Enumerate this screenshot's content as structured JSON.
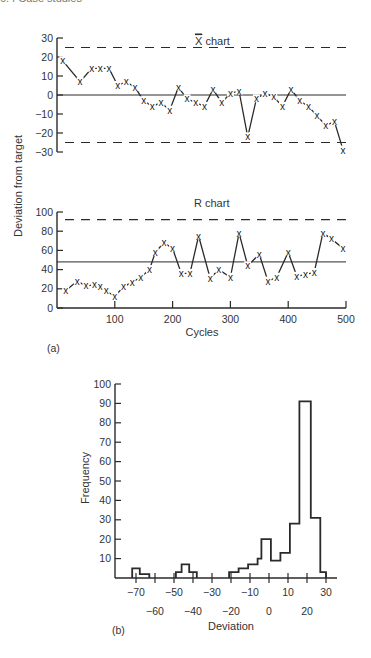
{
  "page": {
    "header_fragment": "6.4  Case studies"
  },
  "panel_a": {
    "label": "(a)",
    "ylabel": "Deviation from target",
    "xlabel": "Cycles",
    "xbar_title": "X chart",
    "r_title": "R chart"
  },
  "panel_b": {
    "label": "(b)",
    "ylabel": "Frequency",
    "xlabel": "Deviation"
  },
  "chart_data": [
    {
      "type": "line",
      "title": "X̄ chart",
      "xlabel": "Cycles",
      "ylabel": "Deviation from target",
      "xlim": [
        0,
        500
      ],
      "ylim": [
        -30,
        30
      ],
      "yticks": [
        30,
        20,
        10,
        0,
        -10,
        -20,
        -30
      ],
      "marker": "x",
      "center_line": 0,
      "upper_control_limit": 25,
      "lower_control_limit": -25,
      "x": [
        10,
        40,
        60,
        75,
        90,
        105,
        120,
        135,
        150,
        165,
        180,
        195,
        210,
        225,
        240,
        255,
        270,
        285,
        300,
        315,
        330,
        345,
        360,
        375,
        390,
        405,
        420,
        435,
        450,
        465,
        480,
        495
      ],
      "values": [
        18,
        7,
        14,
        14,
        14,
        5,
        7,
        4,
        -3,
        -6,
        -4,
        -8,
        4,
        -2,
        -4,
        -6,
        3,
        -4,
        1,
        2,
        -22,
        -2,
        1,
        -1,
        -6,
        3,
        -3,
        -6,
        -11,
        -16,
        -14,
        -29
      ]
    },
    {
      "type": "line",
      "title": "R chart",
      "xlabel": "Cycles",
      "ylabel": "Deviation from target",
      "xlim": [
        0,
        500
      ],
      "ylim": [
        0,
        100
      ],
      "yticks": [
        100,
        80,
        60,
        40,
        20,
        0
      ],
      "xticks": [
        100,
        200,
        300,
        400,
        500
      ],
      "marker": "x",
      "center_line": 48,
      "upper_control_limit": 92,
      "x": [
        15,
        35,
        50,
        65,
        75,
        85,
        100,
        115,
        130,
        145,
        160,
        170,
        185,
        200,
        215,
        230,
        245,
        265,
        280,
        300,
        315,
        330,
        350,
        365,
        380,
        400,
        415,
        430,
        445,
        460,
        475,
        495
      ],
      "values": [
        18,
        28,
        23,
        24,
        22,
        18,
        12,
        22,
        27,
        32,
        40,
        58,
        68,
        62,
        36,
        36,
        75,
        31,
        40,
        32,
        78,
        44,
        56,
        28,
        32,
        58,
        33,
        35,
        37,
        78,
        72,
        62
      ]
    },
    {
      "type": "bar",
      "subtype": "histogram",
      "xlabel": "Deviation",
      "ylabel": "Frequency",
      "ylim": [
        0,
        100
      ],
      "yticks": [
        10,
        20,
        30,
        40,
        50,
        60,
        70,
        80,
        90,
        100
      ],
      "xticks_upper_row": [
        -70,
        -50,
        -30,
        -10,
        10,
        30
      ],
      "xticks_lower_row": [
        -60,
        -40,
        -20,
        0,
        20
      ],
      "bin_edges": [
        -72,
        -68,
        -63,
        -49,
        -46,
        -42,
        -38,
        -34,
        -21,
        -16,
        -11,
        -6,
        -2,
        2,
        7,
        11,
        16,
        23,
        28,
        30
      ],
      "bins": [
        {
          "from": -72,
          "to": -68,
          "count": 5
        },
        {
          "from": -68,
          "to": -63,
          "count": 2
        },
        {
          "from": -49,
          "to": -46,
          "count": 3
        },
        {
          "from": -46,
          "to": -42,
          "count": 7
        },
        {
          "from": -42,
          "to": -38,
          "count": 3
        },
        {
          "from": -21,
          "to": -16,
          "count": 3
        },
        {
          "from": -16,
          "to": -11,
          "count": 5
        },
        {
          "from": -11,
          "to": -6,
          "count": 7
        },
        {
          "from": -6,
          "to": -4,
          "count": 10
        },
        {
          "from": -4,
          "to": 1,
          "count": 20
        },
        {
          "from": 1,
          "to": 6,
          "count": 9
        },
        {
          "from": 6,
          "to": 11,
          "count": 13
        },
        {
          "from": 11,
          "to": 16,
          "count": 28
        },
        {
          "from": 16,
          "to": 22,
          "count": 91
        },
        {
          "from": 22,
          "to": 27,
          "count": 31
        },
        {
          "from": 27,
          "to": 30,
          "count": 3
        }
      ]
    }
  ]
}
